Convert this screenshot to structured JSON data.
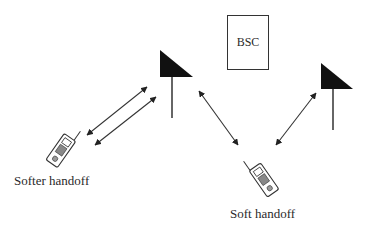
{
  "diagram": {
    "title": "",
    "nodes": {
      "bsc": {
        "label": "BSC",
        "type": "controller-box"
      },
      "base_station_1": {
        "type": "antenna"
      },
      "base_station_2": {
        "type": "antenna"
      },
      "mobile_1": {
        "type": "mobile-phone",
        "caption": "Softer handoff"
      },
      "mobile_2": {
        "type": "mobile-phone",
        "caption": "Soft handoff"
      }
    },
    "links": [
      {
        "from": "mobile_1",
        "to": "base_station_1",
        "style": "bidirectional-arrow"
      },
      {
        "from": "mobile_1",
        "to": "base_station_1",
        "style": "bidirectional-arrow"
      },
      {
        "from": "base_station_1",
        "to": "mobile_2",
        "style": "bidirectional-arrow"
      },
      {
        "from": "mobile_2",
        "to": "base_station_2",
        "style": "bidirectional-arrow"
      }
    ],
    "colors": {
      "stroke": "#333333",
      "fill_antenna": "#111111",
      "background": "#ffffff"
    }
  }
}
